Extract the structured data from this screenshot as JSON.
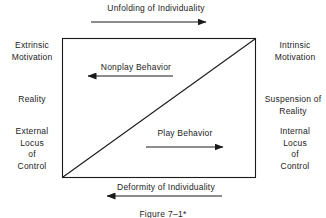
{
  "figure": {
    "caption": "Figure 7–1*",
    "line_color": "#1a1a1a",
    "text_color": "#1c1c1c",
    "background": "#ffffff"
  },
  "axes": {
    "top": {
      "label": "Unfolding of Individuality",
      "arrow_direction": "right",
      "arrow_icon": "arrow-right-icon"
    },
    "bottom": {
      "label": "Deformity of Individuality",
      "arrow_direction": "left",
      "arrow_icon": "arrow-left-icon"
    }
  },
  "inner_flows": [
    {
      "label": "Nonplay Behavior",
      "arrow_direction": "left",
      "arrow_icon": "arrow-left-icon"
    },
    {
      "label": "Play Behavior",
      "arrow_direction": "right",
      "arrow_icon": "arrow-right-icon"
    }
  ],
  "left_labels": [
    {
      "key": "extrinsic_motivation",
      "text": "Extrinsic\nMotivation"
    },
    {
      "key": "reality",
      "text": "Reality"
    },
    {
      "key": "external_locus",
      "text": "External\nLocus\nof\nControl"
    }
  ],
  "right_labels": [
    {
      "key": "intrinsic_motivation",
      "text": "Intrinsic\nMotivation"
    },
    {
      "key": "suspension_reality",
      "text": "Suspension of\nReality"
    },
    {
      "key": "internal_locus",
      "text": "Internal\nLocus\nof\nControl"
    }
  ]
}
